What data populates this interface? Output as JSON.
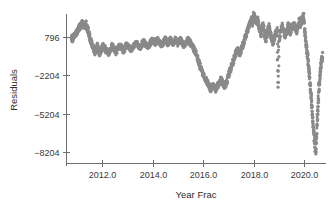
{
  "chart_data": {
    "type": "scatter",
    "title": "",
    "xlabel": "Year Frac",
    "ylabel": "Residuals",
    "xlim": [
      2010.6,
      2020.85
    ],
    "ylim": [
      -9100,
      2600
    ],
    "grid": false,
    "legend": null,
    "marker": {
      "shape": "circle",
      "size": 1.6,
      "color": "#8a8a8a"
    },
    "xticks": [
      2012.0,
      2014.0,
      2016.0,
      2018.0,
      2020.0
    ],
    "xticklabels": [
      "2012.0",
      "2014.0",
      "2016.0",
      "2018.0",
      "2020.0"
    ],
    "yticks": [
      796,
      -2204,
      -5204,
      -8204
    ],
    "yticklabels": [
      "796",
      "-2204",
      "-5204",
      "-8204"
    ],
    "series_name": "residuals",
    "x": [
      2010.8,
      2010.83,
      2010.86,
      2010.89,
      2010.92,
      2010.95,
      2010.98,
      2011.01,
      2011.04,
      2011.07,
      2011.1,
      2011.13,
      2011.16,
      2011.19,
      2011.22,
      2011.25,
      2011.28,
      2011.31,
      2011.34,
      2011.37,
      2011.4,
      2011.43,
      2011.46,
      2011.49,
      2011.52,
      2011.55,
      2011.58,
      2011.61,
      2011.64,
      2011.67,
      2011.7,
      2011.73,
      2011.76,
      2011.79,
      2011.82,
      2011.85,
      2011.88,
      2011.91,
      2011.94,
      2011.97,
      2012.0,
      2012.05,
      2012.1,
      2012.15,
      2012.2,
      2012.25,
      2012.3,
      2012.35,
      2012.4,
      2012.45,
      2012.5,
      2012.55,
      2012.6,
      2012.65,
      2012.7,
      2012.75,
      2012.8,
      2012.85,
      2012.9,
      2012.95,
      2013.0,
      2013.05,
      2013.1,
      2013.15,
      2013.2,
      2013.25,
      2013.3,
      2013.35,
      2013.4,
      2013.45,
      2013.5,
      2013.55,
      2013.6,
      2013.65,
      2013.7,
      2013.75,
      2013.8,
      2013.85,
      2013.9,
      2013.95,
      2014.0,
      2014.05,
      2014.1,
      2014.15,
      2014.2,
      2014.25,
      2014.3,
      2014.35,
      2014.4,
      2014.45,
      2014.5,
      2014.55,
      2014.6,
      2014.65,
      2014.7,
      2014.75,
      2014.8,
      2014.85,
      2014.9,
      2014.95,
      2015.0,
      2015.05,
      2015.1,
      2015.15,
      2015.2,
      2015.25,
      2015.3,
      2015.35,
      2015.4,
      2015.45,
      2015.5,
      2015.55,
      2015.6,
      2015.65,
      2015.7,
      2015.75,
      2015.8,
      2015.85,
      2015.9,
      2015.95,
      2016.0,
      2016.05,
      2016.1,
      2016.15,
      2016.2,
      2016.25,
      2016.3,
      2016.35,
      2016.4,
      2016.45,
      2016.5,
      2016.55,
      2016.6,
      2016.65,
      2016.7,
      2016.75,
      2016.8,
      2016.85,
      2016.9,
      2016.95,
      2017.0,
      2017.05,
      2017.1,
      2017.15,
      2017.2,
      2017.25,
      2017.3,
      2017.35,
      2017.4,
      2017.45,
      2017.5,
      2017.55,
      2017.6,
      2017.65,
      2017.7,
      2017.75,
      2017.8,
      2017.85,
      2017.9,
      2017.95,
      2018.0,
      2018.04,
      2018.08,
      2018.12,
      2018.16,
      2018.2,
      2018.24,
      2018.28,
      2018.32,
      2018.36,
      2018.4,
      2018.44,
      2018.48,
      2018.52,
      2018.56,
      2018.6,
      2018.64,
      2018.68,
      2018.72,
      2018.76,
      2018.8,
      2018.84,
      2018.88,
      2018.92,
      2018.96,
      2019.0,
      2019.04,
      2019.08,
      2019.12,
      2019.16,
      2019.2,
      2019.24,
      2019.28,
      2019.32,
      2019.36,
      2019.4,
      2019.44,
      2019.48,
      2019.52,
      2019.56,
      2019.6,
      2019.64,
      2019.68,
      2019.72,
      2019.76,
      2019.8,
      2019.84,
      2019.88,
      2019.92,
      2019.96,
      2020.0,
      2020.03,
      2020.06,
      2020.09,
      2020.12,
      2020.15,
      2020.18,
      2020.21,
      2020.24,
      2020.27,
      2020.3,
      2020.33,
      2020.36,
      2020.39,
      2020.42,
      2020.45,
      2020.48,
      2020.51,
      2020.54,
      2020.57,
      2020.6,
      2020.63,
      2020.66,
      2020.69,
      2020.72
    ],
    "y": [
      796,
      600,
      750,
      900,
      1050,
      980,
      1150,
      1300,
      1200,
      1400,
      1550,
      1700,
      1600,
      1750,
      1900,
      1800,
      1650,
      1500,
      1700,
      1850,
      1600,
      1450,
      1250,
      1000,
      800,
      600,
      400,
      250,
      100,
      -100,
      -250,
      -400,
      -200,
      -50,
      100,
      -150,
      -300,
      -500,
      -350,
      -200,
      -100,
      150,
      0,
      -200,
      -350,
      -500,
      -300,
      -100,
      100,
      -50,
      -250,
      -400,
      -200,
      0,
      150,
      50,
      -150,
      -300,
      -100,
      100,
      250,
      100,
      -50,
      -200,
      -50,
      100,
      250,
      400,
      250,
      100,
      -50,
      150,
      300,
      450,
      300,
      150,
      0,
      150,
      300,
      450,
      600,
      450,
      300,
      450,
      600,
      450,
      300,
      150,
      300,
      450,
      600,
      450,
      300,
      450,
      600,
      450,
      300,
      450,
      600,
      450,
      300,
      450,
      600,
      450,
      300,
      150,
      300,
      450,
      600,
      450,
      300,
      150,
      0,
      -200,
      -400,
      -700,
      -1000,
      -1300,
      -1600,
      -1900,
      -2100,
      -2300,
      -2500,
      -2700,
      -2900,
      -3100,
      -3300,
      -3100,
      -2900,
      -3100,
      -3300,
      -3100,
      -2900,
      -2700,
      -2500,
      -2700,
      -2900,
      -3100,
      -2800,
      -2500,
      -2200,
      -1900,
      -1600,
      -1300,
      -1000,
      -700,
      -400,
      -100,
      -300,
      -500,
      -200,
      100,
      400,
      700,
      1000,
      1300,
      1600,
      1900,
      2200,
      2000,
      2500,
      2300,
      2100,
      1900,
      2100,
      1700,
      1400,
      1100,
      1500,
      1800,
      1200,
      900,
      600,
      1000,
      1300,
      1600,
      1200,
      900,
      600,
      300,
      700,
      1000,
      1300,
      1000,
      -2300,
      700,
      1000,
      1400,
      1700,
      1400,
      1100,
      800,
      1100,
      1400,
      1700,
      1400,
      1100,
      1400,
      1700,
      1500,
      1800,
      1500,
      1200,
      1500,
      1800,
      2100,
      1800,
      2000,
      2300,
      2500,
      1500,
      900,
      300,
      -100,
      -600,
      -1200,
      -1900,
      -2600,
      -3400,
      -4200,
      -5000,
      -5800,
      -6500,
      -7200,
      -7900,
      -8204,
      -6800,
      -5500,
      -4300,
      -3200,
      -2400,
      -1800,
      -1300,
      -900,
      -600
    ]
  },
  "axes": {
    "y_axis_title": "Residuals",
    "x_axis_title": "Year Frac"
  }
}
